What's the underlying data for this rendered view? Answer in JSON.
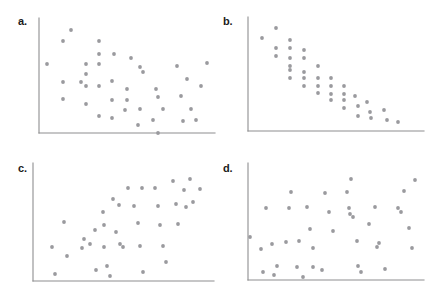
{
  "figure": {
    "title": "",
    "background_color": "#ffffff",
    "axis_color": "#8e8e90",
    "point_color": "#9a9a9e",
    "label_color": "#1b1b1b",
    "point_radius": 1.9
  },
  "panels": [
    {
      "id": "a",
      "label": "a.",
      "label_x": 18,
      "label_y": 16,
      "origin_x": 39,
      "origin_y": 133,
      "axis_top_y": 18,
      "axis_right_x": 215
    },
    {
      "id": "b",
      "label": "b.",
      "label_x": 223,
      "label_y": 16,
      "origin_x": 248,
      "origin_y": 131,
      "axis_top_y": 17,
      "axis_right_x": 424
    },
    {
      "id": "c",
      "label": "c.",
      "label_x": 18,
      "label_y": 163,
      "origin_x": 33,
      "origin_y": 281,
      "axis_top_y": 163,
      "axis_right_x": 214
    },
    {
      "id": "d",
      "label": "d.",
      "label_x": 223,
      "label_y": 163,
      "origin_x": 248,
      "origin_y": 280,
      "axis_top_y": 163,
      "axis_right_x": 424
    }
  ],
  "chart_data": [
    {
      "type": "scatter",
      "panel": "a",
      "title": "a.",
      "xlabel": "",
      "ylabel": "",
      "grid": false,
      "legend": "none",
      "description": "negative linear association, moderate scatter",
      "xlim": [
        39,
        215
      ],
      "ylim": [
        18,
        133
      ],
      "points": [
        [
          47,
          64
        ],
        [
          63,
          41
        ],
        [
          63,
          82
        ],
        [
          63,
          99
        ],
        [
          71,
          30
        ],
        [
          81,
          82
        ],
        [
          86,
          64
        ],
        [
          86,
          74
        ],
        [
          86,
          86
        ],
        [
          86,
          104
        ],
        [
          99,
          54
        ],
        [
          99,
          41
        ],
        [
          99,
          64
        ],
        [
          99,
          86
        ],
        [
          99,
          116
        ],
        [
          112,
          100
        ],
        [
          112,
          81
        ],
        [
          112,
          118
        ],
        [
          114,
          54
        ],
        [
          125,
          110
        ],
        [
          127,
          89
        ],
        [
          127,
          100
        ],
        [
          131,
          58
        ],
        [
          138,
          125
        ],
        [
          140,
          67
        ],
        [
          140,
          109
        ],
        [
          143,
          72
        ],
        [
          153,
          120
        ],
        [
          156,
          89
        ],
        [
          158,
          97
        ],
        [
          158,
          133
        ],
        [
          163,
          109
        ],
        [
          177,
          66
        ],
        [
          181,
          96
        ],
        [
          183,
          121
        ],
        [
          187,
          79
        ],
        [
          191,
          109
        ],
        [
          196,
          120
        ],
        [
          201,
          86
        ],
        [
          207,
          63
        ]
      ]
    },
    {
      "type": "scatter",
      "panel": "b",
      "title": "b.",
      "xlabel": "",
      "ylabel": "",
      "grid": false,
      "legend": "none",
      "description": "strong negative linear association, tight scatter",
      "xlim": [
        248,
        424
      ],
      "ylim": [
        17,
        131
      ],
      "points": [
        [
          262,
          38
        ],
        [
          276,
          28
        ],
        [
          276,
          48
        ],
        [
          276,
          56
        ],
        [
          290,
          40
        ],
        [
          290,
          48
        ],
        [
          290,
          58
        ],
        [
          290,
          66
        ],
        [
          290,
          70
        ],
        [
          290,
          78
        ],
        [
          304,
          50
        ],
        [
          304,
          58
        ],
        [
          304,
          72
        ],
        [
          304,
          78
        ],
        [
          304,
          86
        ],
        [
          318,
          66
        ],
        [
          318,
          78
        ],
        [
          318,
          86
        ],
        [
          318,
          93
        ],
        [
          331,
          78
        ],
        [
          331,
          86
        ],
        [
          331,
          94
        ],
        [
          331,
          100
        ],
        [
          344,
          86
        ],
        [
          344,
          94
        ],
        [
          344,
          100
        ],
        [
          344,
          108
        ],
        [
          355,
          96
        ],
        [
          358,
          106
        ],
        [
          358,
          116
        ],
        [
          367,
          102
        ],
        [
          370,
          112
        ],
        [
          371,
          118
        ],
        [
          384,
          110
        ],
        [
          387,
          120
        ],
        [
          398,
          122
        ]
      ]
    },
    {
      "type": "scatter",
      "panel": "c",
      "title": "c.",
      "xlabel": "",
      "ylabel": "",
      "grid": false,
      "legend": "none",
      "description": "positive linear association, moderate scatter",
      "xlim": [
        33,
        214
      ],
      "ylim": [
        163,
        281
      ],
      "points": [
        [
          52,
          247
        ],
        [
          55,
          274
        ],
        [
          64,
          222
        ],
        [
          67,
          256
        ],
        [
          82,
          248
        ],
        [
          84,
          239
        ],
        [
          90,
          244
        ],
        [
          95,
          230
        ],
        [
          96,
          270
        ],
        [
          103,
          212
        ],
        [
          104,
          225
        ],
        [
          104,
          247
        ],
        [
          107,
          266
        ],
        [
          110,
          276
        ],
        [
          113,
          199
        ],
        [
          116,
          232
        ],
        [
          119,
          205
        ],
        [
          120,
          244
        ],
        [
          123,
          247
        ],
        [
          128,
          188
        ],
        [
          134,
          206
        ],
        [
          138,
          223
        ],
        [
          140,
          246
        ],
        [
          142,
          188
        ],
        [
          143,
          272
        ],
        [
          155,
          188
        ],
        [
          158,
          206
        ],
        [
          160,
          225
        ],
        [
          163,
          246
        ],
        [
          166,
          262
        ],
        [
          173,
          181
        ],
        [
          176,
          204
        ],
        [
          178,
          224
        ],
        [
          184,
          190
        ],
        [
          186,
          207
        ],
        [
          190,
          179
        ],
        [
          193,
          202
        ],
        [
          200,
          189
        ]
      ]
    },
    {
      "type": "scatter",
      "panel": "d",
      "title": "d.",
      "xlabel": "",
      "ylabel": "",
      "grid": false,
      "legend": "none",
      "description": "no association, random scatter",
      "xlim": [
        248,
        424
      ],
      "ylim": [
        163,
        280
      ],
      "points": [
        [
          250,
          237
        ],
        [
          261,
          249
        ],
        [
          263,
          272
        ],
        [
          266,
          208
        ],
        [
          272,
          244
        ],
        [
          274,
          275
        ],
        [
          277,
          266
        ],
        [
          286,
          242
        ],
        [
          289,
          208
        ],
        [
          291,
          192
        ],
        [
          297,
          267
        ],
        [
          299,
          241
        ],
        [
          303,
          277
        ],
        [
          307,
          207
        ],
        [
          310,
          229
        ],
        [
          313,
          248
        ],
        [
          313,
          267
        ],
        [
          322,
          270
        ],
        [
          325,
          193
        ],
        [
          329,
          212
        ],
        [
          333,
          231
        ],
        [
          347,
          192
        ],
        [
          349,
          208
        ],
        [
          350,
          214
        ],
        [
          351,
          179
        ],
        [
          353,
          217
        ],
        [
          357,
          241
        ],
        [
          358,
          266
        ],
        [
          361,
          272
        ],
        [
          369,
          224
        ],
        [
          375,
          207
        ],
        [
          377,
          247
        ],
        [
          379,
          243
        ],
        [
          385,
          269
        ],
        [
          398,
          208
        ],
        [
          401,
          212
        ],
        [
          404,
          191
        ],
        [
          409,
          228
        ],
        [
          412,
          248
        ],
        [
          415,
          180
        ]
      ]
    }
  ]
}
